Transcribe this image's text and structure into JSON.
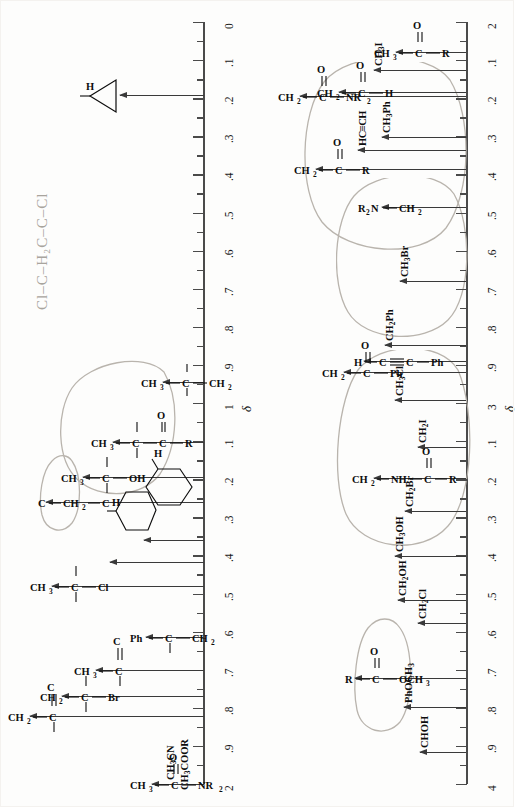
{
  "document": {
    "title": "Proton NMR Chemical Shift Correlation Chart",
    "delta_symbol": "δ",
    "orientation": "page rotated 90 degrees counter-clockwise"
  },
  "chart_data": {
    "type": "table",
    "xlabel": "",
    "ylabel": "δ (ppm)",
    "grid": false,
    "legend": false,
    "scales": [
      {
        "name": "left-scale",
        "range": [
          0,
          2
        ],
        "major_ticks": [
          "0",
          ".1",
          ".2",
          ".3",
          ".4",
          ".5",
          ".6",
          ".7",
          ".8",
          ".9",
          "1",
          ".1",
          ".2",
          ".3",
          ".4",
          ".5",
          ".6",
          ".7",
          ".8",
          ".9",
          "2"
        ],
        "delta_marker_at": 1
      },
      {
        "name": "right-scale",
        "range": [
          2,
          4
        ],
        "major_ticks": [
          "2",
          ".1",
          ".2",
          ".3",
          ".4",
          ".5",
          ".6",
          ".7",
          ".8",
          ".9",
          "3",
          ".1",
          ".2",
          ".3",
          ".4",
          ".5",
          ".6",
          ".7",
          ".8",
          ".9",
          "4"
        ],
        "delta_marker_at": 3
      }
    ],
    "annotations_left": [
      {
        "shift": 0.22,
        "label": "cyclopropane-H",
        "text": "H"
      },
      {
        "shift": 0.9,
        "label": "CH3-C-CH2",
        "text": "CH3—C—CH2"
      },
      {
        "shift": 1.1,
        "label": "CH3-C-C(=O)R",
        "text": "CH3—C—C(=O)R"
      },
      {
        "shift": 1.2,
        "label": "CH3-C-OH",
        "text": "CH3—C(—OH)"
      },
      {
        "shift": 1.25,
        "label": "C-CH2-C",
        "text": "C—CH2—C"
      },
      {
        "shift": 1.45,
        "label": "cyclohexane-H",
        "text": "H"
      },
      {
        "shift": 1.4,
        "label": "cyclopentane-H",
        "text": "H"
      },
      {
        "shift": 1.5,
        "label": "CH3-C-Cl",
        "text": "CH3—C—Cl"
      },
      {
        "shift": 1.6,
        "label": "Ph-C-CH2",
        "text": "Ph—C—CH2"
      },
      {
        "shift": 1.7,
        "label": "CH3-C=C",
        "text": "CH3—C=C"
      },
      {
        "shift": 1.78,
        "label": "CH2-C-Br",
        "text": "CH2—C—Br"
      },
      {
        "shift": 1.8,
        "label": "CH2-C=C",
        "text": "CH2—C=C"
      },
      {
        "shift": 2.0,
        "label": "CH3-C(=O)NR2 / CH3CN / CH3COOR",
        "text": "CH3—C(=O)NR2, CH3CN, CH3COOR"
      }
    ],
    "annotations_right": [
      {
        "shift": 2.1,
        "label": "CH3-C(=O)R",
        "text": "CH3—C(=O)—R"
      },
      {
        "shift": 2.15,
        "label": "CH3I",
        "text": "CH3I"
      },
      {
        "shift": 2.2,
        "label": "CH2-C(=O)H",
        "text": "CH2—C(=O)—H"
      },
      {
        "shift": 2.2,
        "label": "CH2-C(=O)NR2",
        "text": "CH2—C(=O)—NR2"
      },
      {
        "shift": 2.32,
        "label": "CH3Ph",
        "text": "CH3Ph"
      },
      {
        "shift": 2.36,
        "label": "HC-triple-CH",
        "text": "HC≡CH"
      },
      {
        "shift": 2.42,
        "label": "CH2-C(=O)R",
        "text": "CH2—C(=O)—R"
      },
      {
        "shift": 2.5,
        "label": "R2N-CH2",
        "text": "R2N—CH2"
      },
      {
        "shift": 2.7,
        "label": "CH3Br",
        "text": "CH3Br"
      },
      {
        "shift": 2.88,
        "label": "CH2Ph",
        "text": "CH2Ph"
      },
      {
        "shift": 2.92,
        "label": "H-C-triple-C-Ph",
        "text": "H—C≡C—Ph"
      },
      {
        "shift": 2.95,
        "label": "CH2-C(=O)Ph",
        "text": "CH2—C(=O)—Ph"
      },
      {
        "shift": 3.03,
        "label": "CH3Cl",
        "text": "CH3Cl"
      },
      {
        "shift": 3.1,
        "label": "CH2I",
        "text": "CH2I"
      },
      {
        "shift": 3.2,
        "label": "CH2-NH-C(=O)R",
        "text": "CH2—NH—C(=O)—R"
      },
      {
        "shift": 3.3,
        "label": "CH2Br",
        "text": "CH2Br"
      },
      {
        "shift": 3.4,
        "label": "CH3OH",
        "text": "CH3OH"
      },
      {
        "shift": 3.52,
        "label": "CH2OH",
        "text": "CH2OH"
      },
      {
        "shift": 3.6,
        "label": "CH2Cl",
        "text": "CH2Cl"
      },
      {
        "shift": 3.7,
        "label": "R-C(=O)-OCH3",
        "text": "R—C(=O)—OCH3"
      },
      {
        "shift": 3.8,
        "label": "PhOCH3",
        "text": "PhOCH3"
      },
      {
        "shift": 3.9,
        "label": "CHOH",
        "text": "CHOH"
      }
    ]
  },
  "labels": {
    "H": "H",
    "CH3": "CH",
    "CH3_sub": "3",
    "CH2": "CH",
    "CH2_sub": "2",
    "CH3I": "CH",
    "CH3I_sub": "3",
    "CH3I_tail": "I",
    "CH2I": "CH",
    "CH2I_sub": "2",
    "CH2I_tail": "I",
    "CH3Ph": "CH",
    "CH3Ph_sub": "3",
    "CH3Ph_tail": "Ph",
    "CH2Ph": "CH",
    "CH2Ph_sub": "2",
    "CH2Ph_tail": "Ph",
    "CH3Br": "CH",
    "CH3Br_sub": "3",
    "CH3Br_tail": "Br",
    "CH2Br": "CH",
    "CH2Br_sub": "2",
    "CH2Br_tail": "Br",
    "CH3Cl": "CH",
    "CH3Cl_sub": "3",
    "CH3Cl_tail": "Cl",
    "CH2Cl": "CH",
    "CH2Cl_sub": "2",
    "CH2Cl_tail": "Cl",
    "CH3OH": "CH",
    "CH3OH_sub": "3",
    "CH3OH_tail": "OH",
    "CH2OH": "CH",
    "CH2OH_sub": "2",
    "CH2OH_tail": "OH",
    "CHOH": "CHOH",
    "PhOCH3": "PhOCH",
    "PhOCH3_sub": "3",
    "HCCH": "HC≡CH",
    "R2N": "R",
    "R2N_sub": "2",
    "R2N_tail": "N—CH",
    "R2N_tail_sub": "2",
    "CH3CN": "CH",
    "CH3CN_sub": "3",
    "CH3CN_tail": "CN",
    "CH3COOR": "CH",
    "CH3COOR_sub": "3",
    "CH3COOR_tail": "COOR",
    "NR2": "NR",
    "NR2_sub": "2",
    "O": "O",
    "R": "R",
    "C": "C",
    "Ph": "Ph",
    "Cl": "Cl",
    "Br": "Br",
    "OH": "OH",
    "OCH3": "OCH",
    "OCH3_sub": "3",
    "NH": "NH"
  },
  "axis_ticks": {
    "left": [
      "0",
      ".1",
      ".2",
      ".3",
      ".4",
      ".5",
      ".6",
      ".7",
      ".8",
      ".9",
      "1",
      ".1",
      ".2",
      ".3",
      ".4",
      ".5",
      ".6",
      ".7",
      ".8",
      ".9",
      "2"
    ],
    "right": [
      "2",
      ".1",
      ".2",
      ".3",
      ".4",
      ".5",
      ".6",
      ".7",
      ".8",
      ".9",
      "3",
      ".1",
      ".2",
      ".3",
      ".4",
      ".5",
      ".6",
      ".7",
      ".8",
      ".9",
      "4"
    ]
  },
  "handwriting": {
    "formula_note": "Cl–C–H₂C–C–Cl",
    "circles_left": [
      "circle around CH3-C-OH / CH3-C-C(=O)R group",
      "small circle around C-CH2-C"
    ],
    "circles_right": [
      "large circle around CH2/CH3 carbonyl group 2.1-2.5",
      "circle around R2N-CH2 / CH3Br 2.4-2.8",
      "circle around CH2Ph to CH2Br 2.9-3.35",
      "circle around R-C(=O)-OCH3"
    ]
  }
}
